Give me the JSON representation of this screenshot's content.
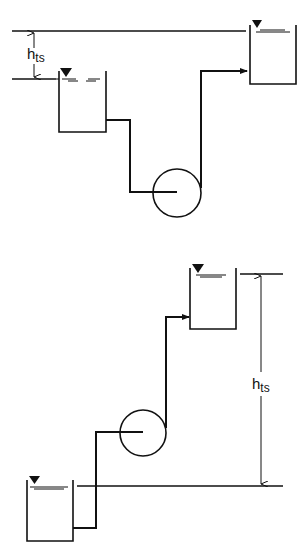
{
  "diagrams": [
    {
      "id": "suction-head",
      "label_main": "h",
      "label_sub": "ts"
    },
    {
      "id": "suction-lift",
      "label_main": "h",
      "label_sub": "ts"
    }
  ],
  "colors": {
    "stroke": "#111111",
    "background": "#ffffff"
  }
}
